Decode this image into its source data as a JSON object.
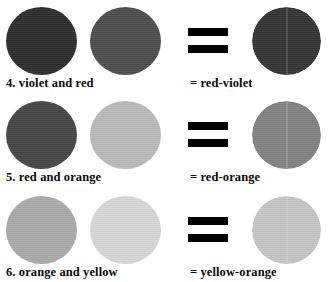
{
  "page": {
    "background": "#ffffff",
    "text_color": "#0a0a0a",
    "equals_color": "#000000"
  },
  "equals_symbol": {
    "name": "equals-sign",
    "glyph": "="
  },
  "rows": [
    {
      "number": "4",
      "left_caption": "4. violet and red",
      "right_caption": "= red-violet",
      "source_a": {
        "label": "violet",
        "color": "#2d2d2d"
      },
      "source_b": {
        "label": "red",
        "color": "#4d4d4d"
      },
      "result": {
        "label": "red-violet",
        "color": "#343434"
      }
    },
    {
      "number": "5",
      "left_caption": "5. red and orange",
      "right_caption": "= red-orange",
      "source_a": {
        "label": "red",
        "color": "#464646"
      },
      "source_b": {
        "label": "orange",
        "color": "#b9b9b9"
      },
      "result": {
        "label": "red-orange",
        "color": "#828282"
      }
    },
    {
      "number": "6",
      "left_caption": "6. orange and yellow",
      "right_caption": "= yellow-orange",
      "source_a": {
        "label": "orange",
        "color": "#a9a9a9"
      },
      "source_b": {
        "label": "yellow",
        "color": "#d6d6d6"
      },
      "result": {
        "label": "yellow-orange",
        "color": "#c4c4c4"
      }
    }
  ]
}
